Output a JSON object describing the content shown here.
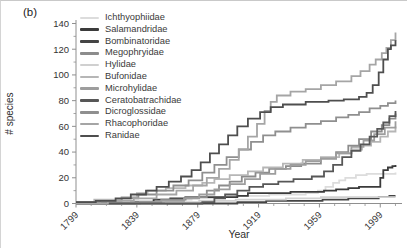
{
  "figure": {
    "panel_label": "(b)",
    "ylabel": "# species",
    "xlabel": "Year"
  },
  "chart_data": {
    "type": "line",
    "title": "",
    "xlabel": "Year",
    "ylabel": "# species",
    "line_style": "step-after",
    "grid": false,
    "legend_position": "upper-left-inside",
    "xlim": [
      1799,
      2010
    ],
    "ylim": [
      0,
      140
    ],
    "x_ticks": [
      1799,
      1839,
      1879,
      1919,
      1959,
      1999
    ],
    "y_ticks": [
      0,
      20,
      40,
      60,
      80,
      100,
      120,
      140
    ],
    "x_minor_step": 10,
    "y_minor_step": 10,
    "axis_color": "#8f8f8f",
    "tick_label_color": "#333333",
    "series": [
      {
        "name": "Ichthyophiidae",
        "color": "#dcdcdc",
        "points": [
          [
            1799,
            0
          ],
          [
            1822,
            1
          ],
          [
            1833,
            2
          ],
          [
            1860,
            3
          ],
          [
            1875,
            4
          ],
          [
            1890,
            5
          ],
          [
            1904,
            6
          ],
          [
            1926,
            7
          ],
          [
            1950,
            8
          ],
          [
            1958,
            10
          ],
          [
            1963,
            13
          ],
          [
            1968,
            16
          ],
          [
            1972,
            18
          ],
          [
            1976,
            20
          ],
          [
            1983,
            22
          ],
          [
            1990,
            23
          ],
          [
            2009,
            24
          ]
        ]
      },
      {
        "name": "Salamandridae",
        "color": "#3b3b3b",
        "points": [
          [
            1799,
            0
          ],
          [
            1838,
            1
          ],
          [
            1850,
            3
          ],
          [
            1861,
            4
          ],
          [
            1871,
            5
          ],
          [
            1905,
            6
          ],
          [
            1912,
            8
          ],
          [
            1940,
            9
          ],
          [
            1962,
            10
          ],
          [
            1970,
            11
          ],
          [
            1978,
            12
          ],
          [
            1985,
            13
          ],
          [
            1995,
            13
          ],
          [
            1999,
            20
          ],
          [
            2001,
            26
          ],
          [
            2004,
            28
          ],
          [
            2007,
            29
          ],
          [
            2009,
            30
          ]
        ]
      },
      {
        "name": "Bombinatoridae",
        "color": "#454545",
        "points": [
          [
            1799,
            0
          ],
          [
            1905,
            1
          ],
          [
            1924,
            2
          ],
          [
            1961,
            3
          ],
          [
            1978,
            4
          ],
          [
            1998,
            5
          ],
          [
            2005,
            6
          ],
          [
            2009,
            6
          ]
        ]
      },
      {
        "name": "Megophryidae",
        "color": "#8c8c8c",
        "points": [
          [
            1799,
            0
          ],
          [
            1835,
            1
          ],
          [
            1855,
            3
          ],
          [
            1871,
            5
          ],
          [
            1885,
            10
          ],
          [
            1893,
            14
          ],
          [
            1900,
            17
          ],
          [
            1908,
            21
          ],
          [
            1917,
            24
          ],
          [
            1926,
            27
          ],
          [
            1937,
            29
          ],
          [
            1947,
            31
          ],
          [
            1960,
            35
          ],
          [
            1970,
            40
          ],
          [
            1978,
            45
          ],
          [
            1985,
            50
          ],
          [
            1993,
            56
          ],
          [
            2000,
            61
          ],
          [
            2005,
            66
          ],
          [
            2009,
            70
          ]
        ]
      },
      {
        "name": "Hylidae",
        "color": "#d0d0d0",
        "points": [
          [
            1799,
            0
          ],
          [
            1858,
            1
          ],
          [
            1880,
            2
          ],
          [
            1904,
            3
          ],
          [
            1937,
            4
          ],
          [
            1960,
            5
          ],
          [
            2009,
            5
          ]
        ]
      },
      {
        "name": "Bufonidae",
        "color": "#b6b6b6",
        "points": [
          [
            1799,
            1
          ],
          [
            1811,
            3
          ],
          [
            1829,
            5
          ],
          [
            1839,
            8
          ],
          [
            1846,
            10
          ],
          [
            1858,
            12
          ],
          [
            1871,
            14
          ],
          [
            1882,
            16
          ],
          [
            1890,
            19
          ],
          [
            1900,
            22
          ],
          [
            1912,
            25
          ],
          [
            1922,
            28
          ],
          [
            1935,
            31
          ],
          [
            1948,
            34
          ],
          [
            1960,
            36
          ],
          [
            1972,
            39
          ],
          [
            1980,
            42
          ],
          [
            1987,
            45
          ],
          [
            1993,
            48
          ],
          [
            1999,
            52
          ],
          [
            2004,
            56
          ],
          [
            2009,
            60
          ]
        ]
      },
      {
        "name": "Microhylidae",
        "color": "#9d9d9d",
        "points": [
          [
            1799,
            0
          ],
          [
            1841,
            1
          ],
          [
            1855,
            2
          ],
          [
            1870,
            4
          ],
          [
            1880,
            7
          ],
          [
            1890,
            11
          ],
          [
            1900,
            15
          ],
          [
            1910,
            19
          ],
          [
            1920,
            23
          ],
          [
            1930,
            27
          ],
          [
            1940,
            30
          ],
          [
            1950,
            33
          ],
          [
            1960,
            35
          ],
          [
            1970,
            39
          ],
          [
            1980,
            44
          ],
          [
            1988,
            49
          ],
          [
            1995,
            54
          ],
          [
            2002,
            59
          ],
          [
            2009,
            64
          ]
        ]
      },
      {
        "name": "Ceratobatrachidae",
        "color": "#575757",
        "points": [
          [
            1799,
            0
          ],
          [
            1882,
            1
          ],
          [
            1890,
            4
          ],
          [
            1897,
            7
          ],
          [
            1905,
            10
          ],
          [
            1913,
            13
          ],
          [
            1922,
            15
          ],
          [
            1932,
            17
          ],
          [
            1942,
            19
          ],
          [
            1954,
            21
          ],
          [
            1962,
            25
          ],
          [
            1968,
            30
          ],
          [
            1974,
            36
          ],
          [
            1980,
            41
          ],
          [
            1986,
            46
          ],
          [
            1992,
            52
          ],
          [
            1997,
            58
          ],
          [
            2001,
            63
          ],
          [
            2005,
            68
          ],
          [
            2009,
            72
          ]
        ]
      },
      {
        "name": "Dicroglossidae",
        "color": "#8f8f8f",
        "points": [
          [
            1799,
            1
          ],
          [
            1815,
            2
          ],
          [
            1829,
            4
          ],
          [
            1840,
            7
          ],
          [
            1852,
            10
          ],
          [
            1863,
            14
          ],
          [
            1873,
            18
          ],
          [
            1882,
            24
          ],
          [
            1890,
            30
          ],
          [
            1898,
            36
          ],
          [
            1906,
            42
          ],
          [
            1914,
            48
          ],
          [
            1922,
            53
          ],
          [
            1930,
            56
          ],
          [
            1940,
            59
          ],
          [
            1950,
            62
          ],
          [
            1960,
            64
          ],
          [
            1970,
            67
          ],
          [
            1978,
            69
          ],
          [
            1985,
            71
          ],
          [
            1992,
            74
          ],
          [
            1999,
            76
          ],
          [
            2004,
            78
          ],
          [
            2009,
            80
          ]
        ]
      },
      {
        "name": "Rhacophoridae",
        "color": "#a5a5a5",
        "points": [
          [
            1799,
            0
          ],
          [
            1820,
            2
          ],
          [
            1837,
            4
          ],
          [
            1852,
            7
          ],
          [
            1865,
            10
          ],
          [
            1876,
            14
          ],
          [
            1885,
            20
          ],
          [
            1893,
            27
          ],
          [
            1900,
            34
          ],
          [
            1906,
            42
          ],
          [
            1912,
            52
          ],
          [
            1918,
            62
          ],
          [
            1923,
            72
          ],
          [
            1927,
            79
          ],
          [
            1931,
            84
          ],
          [
            1940,
            87
          ],
          [
            1950,
            89
          ],
          [
            1960,
            92
          ],
          [
            1970,
            95
          ],
          [
            1980,
            99
          ],
          [
            1986,
            103
          ],
          [
            1992,
            108
          ],
          [
            1996,
            112
          ],
          [
            2000,
            117
          ],
          [
            2003,
            121
          ],
          [
            2006,
            127
          ],
          [
            2009,
            133
          ]
        ]
      },
      {
        "name": "Ranidae",
        "color": "#4e4e4e",
        "points": [
          [
            1799,
            1
          ],
          [
            1812,
            2
          ],
          [
            1825,
            4
          ],
          [
            1835,
            7
          ],
          [
            1845,
            10
          ],
          [
            1852,
            13
          ],
          [
            1860,
            17
          ],
          [
            1868,
            21
          ],
          [
            1875,
            26
          ],
          [
            1881,
            32
          ],
          [
            1887,
            39
          ],
          [
            1893,
            46
          ],
          [
            1899,
            53
          ],
          [
            1905,
            60
          ],
          [
            1912,
            66
          ],
          [
            1920,
            71
          ],
          [
            1927,
            75
          ],
          [
            1935,
            77
          ],
          [
            1950,
            79
          ],
          [
            1965,
            80
          ],
          [
            1975,
            81
          ],
          [
            1985,
            83
          ],
          [
            1990,
            86
          ],
          [
            1994,
            92
          ],
          [
            1998,
            102
          ],
          [
            2001,
            112
          ],
          [
            2004,
            120
          ],
          [
            2006,
            123
          ],
          [
            2009,
            127
          ]
        ]
      }
    ]
  }
}
